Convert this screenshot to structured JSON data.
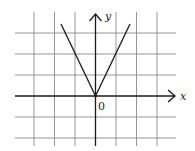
{
  "figure": {
    "type": "function-graph",
    "function": "y = 2|x|",
    "axes": {
      "x_label": "x",
      "y_label": "y",
      "origin_label": "0"
    },
    "grid": {
      "x_range": [
        -4,
        3
      ],
      "y_range": [
        -2,
        3
      ],
      "step": 1
    },
    "curve": {
      "points": [
        [
          -1.65,
          3.3
        ],
        [
          0,
          0
        ],
        [
          1.7,
          3.4
        ]
      ]
    }
  }
}
